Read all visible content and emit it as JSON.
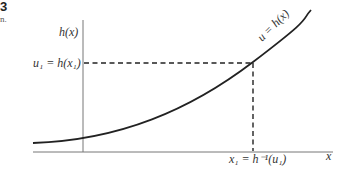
{
  "figure": {
    "number": "3",
    "caption_fragment": "n."
  },
  "diagram": {
    "y_axis_label": "h(x)",
    "x_axis_label": "x",
    "curve_label": "u = h(x)",
    "u1_label": "u₁ = h(x₁)",
    "x1_label": "x₁ = h⁻¹(u₁)",
    "colors": {
      "curve": "#222222",
      "axis": "#777777",
      "dashed": "#222222"
    }
  }
}
